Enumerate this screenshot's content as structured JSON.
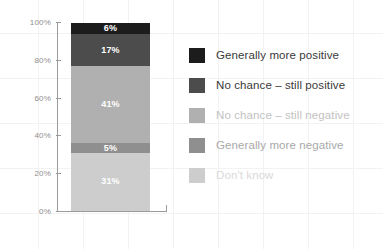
{
  "chart_data": {
    "type": "bar",
    "subtype": "stacked-bar-single-category",
    "title": "",
    "subtitle": "",
    "xlabel": "",
    "ylabel": "",
    "categories": [
      ""
    ],
    "ylim": [
      0,
      100
    ],
    "y_ticks": [
      "0%",
      "20%",
      "40%",
      "60%",
      "80%",
      "100%"
    ],
    "y_tick_values": [
      0,
      20,
      40,
      60,
      80,
      100
    ],
    "grid": true,
    "legend_position": "right",
    "stack_order_bottom_to_top": [
      "Don't know",
      "Generally more negative",
      "No chance – still negative",
      "No chance – still positive",
      "Generally more positive"
    ],
    "series": [
      {
        "name": "Generally more positive",
        "value": 6,
        "label": "6%",
        "color": "#1c1c1c",
        "label_color": "#ffffff",
        "legend_text_color": "#3a3a3a"
      },
      {
        "name": "No chance – still positive",
        "value": 17,
        "label": "17%",
        "color": "#4c4c4c",
        "label_color": "#ffffff",
        "legend_text_color": "#3a3a3a"
      },
      {
        "name": "No chance – still negative",
        "value": 41,
        "label": "41%",
        "color": "#b0b0b0",
        "label_color": "#ffffff",
        "legend_text_color": "#c2c2c2"
      },
      {
        "name": "Generally more negative",
        "value": 5,
        "label": "5%",
        "color": "#8f8f8f",
        "label_color": "#ffffff",
        "legend_text_color": "#a8a8a8"
      },
      {
        "name": "Don't know",
        "value": 31,
        "label": "31%",
        "color": "#cdcdcd",
        "label_color": "#ffffff",
        "legend_text_color": "#dadada"
      }
    ]
  },
  "axis": {
    "line_color": "#9a9a9a",
    "tick_label_color": "#8e8e8e"
  }
}
